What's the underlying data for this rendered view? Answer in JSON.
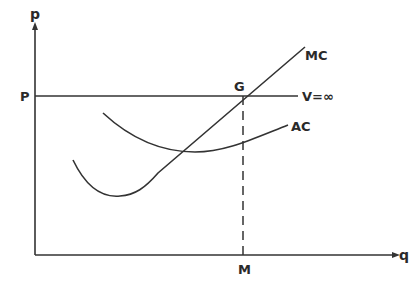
{
  "diagram": {
    "axes": {
      "y_label": "p",
      "x_label": "q"
    },
    "labels": {
      "price": "P",
      "equilibrium_point": "G",
      "quantity": "M",
      "marginal_cost": "MC",
      "average_cost": "AC",
      "demand": "V=∞"
    },
    "colors": {
      "line": "#333333",
      "background": "#ffffff"
    }
  }
}
